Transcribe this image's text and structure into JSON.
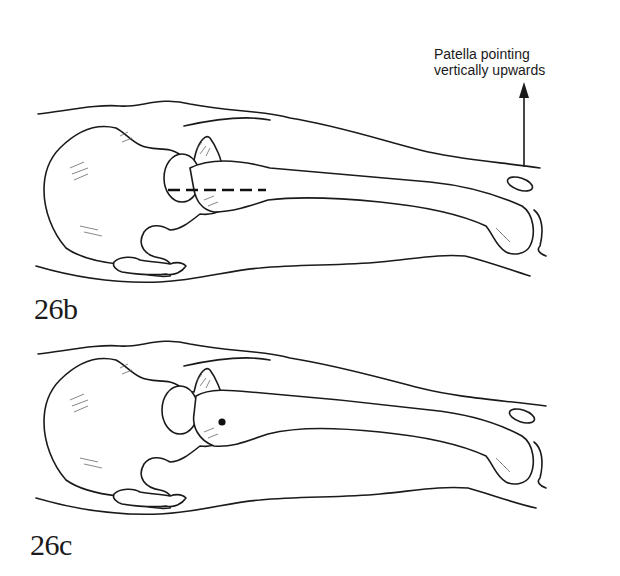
{
  "figures": [
    {
      "label": "26b",
      "annotation": {
        "line1": "Patella pointing",
        "line2": "vertically upwards"
      },
      "has_dashed_axis_line": true,
      "has_arrow": true
    },
    {
      "label": "26c",
      "has_dot_marker": true
    }
  ],
  "colors": {
    "ink": "#1a1a1a",
    "background": "#ffffff"
  }
}
